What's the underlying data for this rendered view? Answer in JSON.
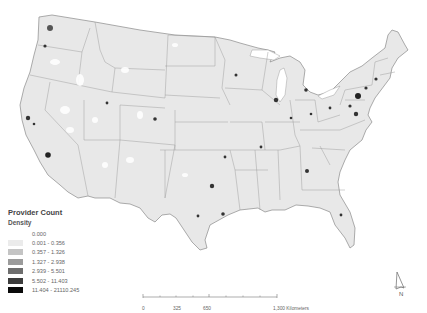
{
  "legend": {
    "title": "Provider Count",
    "subtitle": "Density",
    "classes": [
      {
        "label": "0.000",
        "color": "#ffffff"
      },
      {
        "label": "0.001 - 0.356",
        "color": "#ebebeb"
      },
      {
        "label": "0.357 - 1.326",
        "color": "#c4c4c4"
      },
      {
        "label": "1.327 - 2.938",
        "color": "#9b9b9b"
      },
      {
        "label": "2.939 - 5.501",
        "color": "#6e6e6e"
      },
      {
        "label": "5.502 - 11.403",
        "color": "#3c3c3c"
      },
      {
        "label": "11.404 - 21110.245",
        "color": "#0a0a0a"
      }
    ]
  },
  "scale_bar": {
    "ticks": [
      "0",
      "325",
      "650",
      "1,300 Kilometers"
    ]
  },
  "north_arrow": {
    "label": "N"
  },
  "map": {
    "region": "Contiguous United States",
    "base_fill": "#e8e8e8",
    "border_color": "#8a8a8a"
  }
}
